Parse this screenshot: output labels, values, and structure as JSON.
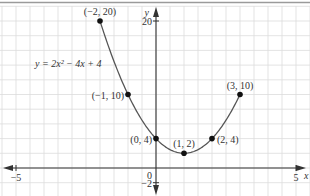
{
  "chart_data": {
    "type": "line",
    "title": "",
    "equation_label": "y = 2x² − 4x + 4",
    "xlabel": "x",
    "ylabel": "y",
    "xlim": [
      -5,
      5
    ],
    "ylim": [
      -2,
      20
    ],
    "x_ticks": [
      {
        "value": -5,
        "label": "−5"
      },
      {
        "value": 5,
        "label": "5"
      }
    ],
    "y_ticks": [
      {
        "value": 20,
        "label": "20"
      },
      {
        "value": -2,
        "label": "−2"
      }
    ],
    "origin_label": "0",
    "grid": true,
    "series": [
      {
        "name": "y = 2x^2 - 4x + 4",
        "x": [
          -2,
          -1,
          0,
          1,
          2,
          3
        ],
        "y": [
          20,
          10,
          4,
          2,
          4,
          10
        ]
      }
    ],
    "points": [
      {
        "x": -2,
        "y": 20,
        "label": "(−2, 20)"
      },
      {
        "x": -1,
        "y": 10,
        "label": "(−1, 10)"
      },
      {
        "x": 0,
        "y": 4,
        "label": "(0, 4)"
      },
      {
        "x": 1,
        "y": 2,
        "label": "(1, 2)"
      },
      {
        "x": 2,
        "y": 4,
        "label": "(2, 4)"
      },
      {
        "x": 3,
        "y": 10,
        "label": "(3, 10)"
      }
    ],
    "colors": {
      "curve": "#555555",
      "points": "#111111",
      "grid": "#dcdcdc",
      "axes": "#333333"
    }
  }
}
